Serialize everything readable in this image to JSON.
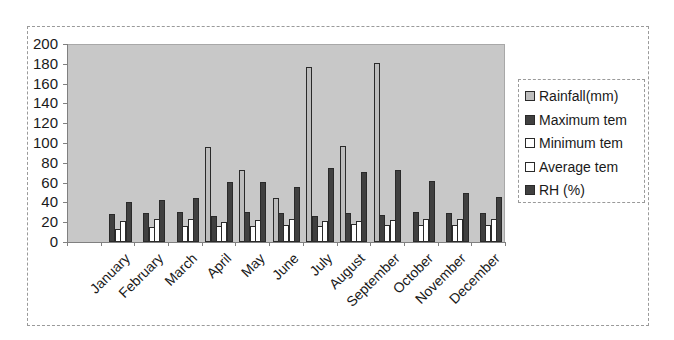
{
  "chart_data": {
    "type": "bar",
    "title": "",
    "xlabel": "",
    "ylabel": "",
    "ylim": [
      0,
      200
    ],
    "yticks": [
      0,
      20,
      40,
      60,
      80,
      100,
      120,
      140,
      160,
      180,
      200
    ],
    "grid": false,
    "legend_position": "right",
    "categories": [
      "",
      "January",
      "February",
      "March",
      "April",
      "May",
      "June",
      "July",
      "August",
      "September",
      "October",
      "November",
      "December"
    ],
    "series": [
      {
        "name": "Rainfall(mm)",
        "color": "#bdbdbd",
        "values": [
          0,
          0,
          0,
          0,
          96,
          73,
          44,
          177,
          97,
          181,
          0,
          0,
          0
        ]
      },
      {
        "name": "Maximum tem",
        "color": "#404040",
        "values": [
          0,
          28,
          29,
          30,
          26,
          30,
          29,
          26,
          29,
          27,
          30,
          29,
          29
        ]
      },
      {
        "name": "Minimum tem",
        "color": "#ffffff",
        "values": [
          0,
          13,
          15,
          16,
          16,
          16,
          17,
          16,
          18,
          17,
          17,
          17,
          17
        ]
      },
      {
        "name": "Average tem",
        "color": "#ffffff",
        "values": [
          0,
          21,
          23,
          23,
          20,
          22,
          23,
          21,
          21,
          22,
          23,
          23,
          23
        ]
      },
      {
        "name": "RH (%)",
        "color": "#404040",
        "values": [
          0,
          40,
          42,
          44,
          61,
          61,
          56,
          75,
          71,
          73,
          62,
          49,
          45
        ]
      }
    ]
  },
  "colors": {
    "plot_background": "#c8c8c8",
    "axis": "#808080",
    "bar_border": "#2a2a2a"
  }
}
